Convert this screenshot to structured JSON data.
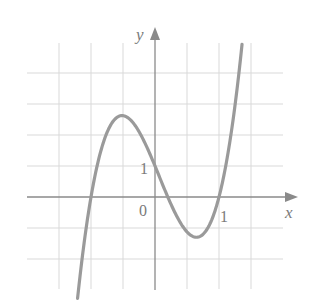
{
  "chart_data": {
    "type": "line",
    "title": "",
    "xlabel": "x",
    "ylabel": "y",
    "function": "y = 5(x+1)(x-0.2)(x-1)",
    "x_tick_labels": [
      {
        "value": 1,
        "label": "1"
      }
    ],
    "y_tick_labels": [
      {
        "value": 1,
        "label": "1"
      }
    ],
    "origin_label": "0",
    "xlim": [
      -2.0,
      2.2
    ],
    "ylim": [
      -3.0,
      5.0
    ],
    "grid": true,
    "grid_x_step": 0.5,
    "grid_y_step": 1,
    "x_range_drawn": [
      -1.21,
      1.36
    ],
    "key_points": [
      {
        "x": -1,
        "y": 0,
        "note": "root"
      },
      {
        "x": -0.5,
        "y": 2.6,
        "note": "local max"
      },
      {
        "x": 0,
        "y": 1,
        "note": "y-intercept"
      },
      {
        "x": 0.2,
        "y": 0,
        "note": "root"
      },
      {
        "x": 0.62,
        "y": -1.28,
        "note": "local min"
      },
      {
        "x": 1,
        "y": 0,
        "note": "root"
      }
    ],
    "series": [
      {
        "name": "f(x)",
        "x": [
          -1.2,
          -1.0,
          -0.8,
          -0.6,
          -0.5,
          -0.4,
          -0.2,
          0.0,
          0.2,
          0.4,
          0.6,
          0.8,
          1.0,
          1.2,
          1.36
        ],
        "y": [
          -3.08,
          0.0,
          1.8,
          2.56,
          2.63,
          2.52,
          1.92,
          1.0,
          0.0,
          -0.84,
          -1.28,
          -1.08,
          0.0,
          2.2,
          4.93
        ]
      }
    ]
  },
  "labels": {
    "x_axis": "x",
    "y_axis": "y",
    "origin": "0",
    "x_one": "1",
    "y_one": "1"
  },
  "colors": {
    "curve": "#9a9a9a",
    "axis": "#8a8a8a",
    "grid": "#d9d9d9",
    "text": "#7a7a7a"
  }
}
